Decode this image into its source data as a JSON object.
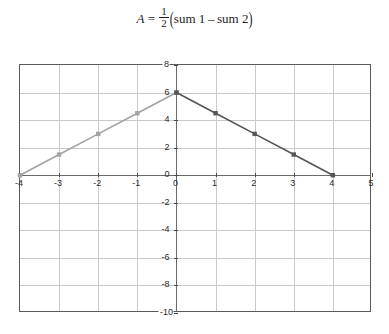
{
  "title": {
    "variable": "A",
    "equals": "=",
    "numerator": "1",
    "denominator": "2",
    "open_paren": "(",
    "term1": "sum 1",
    "minus": "–",
    "term2": "sum 2",
    "close_paren": ")",
    "plain": "A = 1/2 (sum 1 - sum 2)"
  },
  "chart_data": {
    "type": "line",
    "xlabel": "",
    "ylabel": "",
    "xlim": [
      -4,
      5
    ],
    "ylim": [
      -10,
      8
    ],
    "xticks": [
      -4,
      -3,
      -2,
      -1,
      0,
      1,
      2,
      3,
      4,
      5
    ],
    "yticks": [
      8,
      6,
      4,
      2,
      0,
      -2,
      -4,
      -6,
      -8,
      -10
    ],
    "xticklabels": [
      "-4",
      "-3",
      "-2",
      "-1",
      "0",
      "1",
      "2",
      "3",
      "4",
      "5"
    ],
    "yticklabels": [
      "8",
      "6",
      "4",
      "2",
      "0",
      "-2",
      "-4",
      "-6",
      "-8",
      "-10"
    ],
    "grid": true,
    "legend": false,
    "series": [
      {
        "name": "sum 1",
        "color": "#a3a3a3",
        "marker": "square",
        "x": [
          -4,
          -3,
          -2,
          -1,
          0
        ],
        "y": [
          0,
          1.5,
          3,
          4.5,
          6
        ]
      },
      {
        "name": "sum 2",
        "color": "#555555",
        "marker": "square",
        "x": [
          0,
          1,
          2,
          3,
          4
        ],
        "y": [
          6,
          4.5,
          3,
          1.5,
          0
        ]
      }
    ]
  },
  "colors": {
    "series_light": "#a3a3a3",
    "series_dark": "#555555",
    "grid": "#c9c9c9",
    "axis": "#6a6a6a",
    "frame": "#5a5a5a",
    "text": "#2a2a2a",
    "background": "#ffffff"
  }
}
